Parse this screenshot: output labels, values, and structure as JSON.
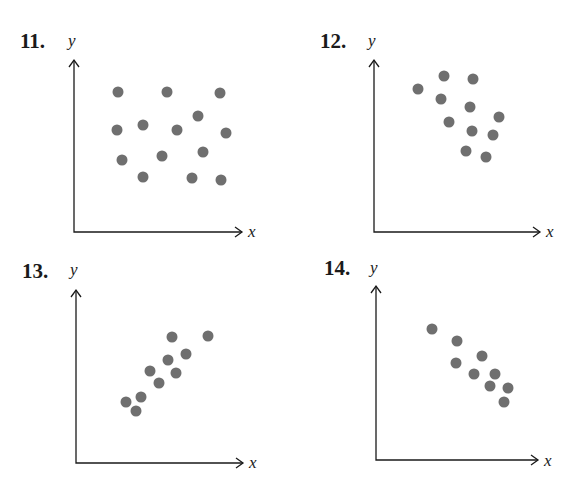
{
  "chart_data": [
    {
      "type": "scatter",
      "title": "11.",
      "xlabel": "x",
      "ylabel": "y",
      "grid": false,
      "description": "No correlation",
      "points_px": [
        [
          118,
          92
        ],
        [
          167,
          92
        ],
        [
          220,
          93
        ],
        [
          198,
          116
        ],
        [
          117,
          130
        ],
        [
          143,
          125
        ],
        [
          177,
          130
        ],
        [
          226,
          133
        ],
        [
          122,
          160
        ],
        [
          162,
          156
        ],
        [
          203,
          152
        ],
        [
          143,
          177
        ],
        [
          192,
          178
        ],
        [
          221,
          180
        ]
      ],
      "axes_px": {
        "origin": [
          74,
          232
        ],
        "y_top": 60,
        "x_right": 242
      }
    },
    {
      "type": "scatter",
      "title": "12.",
      "xlabel": "x",
      "ylabel": "y",
      "grid": false,
      "description": "Negative correlation (weak)",
      "points_px": [
        [
          418,
          89
        ],
        [
          444,
          76
        ],
        [
          473,
          79
        ],
        [
          441,
          99
        ],
        [
          470,
          107
        ],
        [
          499,
          117
        ],
        [
          449,
          122
        ],
        [
          472,
          131
        ],
        [
          493,
          135
        ],
        [
          466,
          151
        ],
        [
          486,
          157
        ]
      ],
      "axes_px": {
        "origin": [
          374,
          232
        ],
        "y_top": 60,
        "x_right": 540
      }
    },
    {
      "type": "scatter",
      "title": "13.",
      "xlabel": "x",
      "ylabel": "y",
      "grid": false,
      "description": "Positive correlation",
      "points_px": [
        [
          172,
          337
        ],
        [
          208,
          336
        ],
        [
          186,
          354
        ],
        [
          168,
          360
        ],
        [
          150,
          371
        ],
        [
          176,
          373
        ],
        [
          159,
          383
        ],
        [
          141,
          397
        ],
        [
          126,
          402
        ],
        [
          136,
          411
        ]
      ],
      "axes_px": {
        "origin": [
          76,
          463
        ],
        "y_top": 290,
        "x_right": 243
      }
    },
    {
      "type": "scatter",
      "title": "14.",
      "xlabel": "x",
      "ylabel": "y",
      "grid": false,
      "description": "Negative correlation (strong)",
      "points_px": [
        [
          432,
          329
        ],
        [
          457,
          341
        ],
        [
          482,
          356
        ],
        [
          456,
          363
        ],
        [
          474,
          374
        ],
        [
          495,
          374
        ],
        [
          490,
          386
        ],
        [
          508,
          388
        ],
        [
          504,
          402
        ]
      ],
      "axes_px": {
        "origin": [
          376,
          460
        ],
        "y_top": 286,
        "x_right": 538
      }
    }
  ],
  "labels": {
    "p11": {
      "num": "11.",
      "y": "y",
      "x": "x"
    },
    "p12": {
      "num": "12.",
      "y": "y",
      "x": "x"
    },
    "p13": {
      "num": "13.",
      "y": "y",
      "x": "x"
    },
    "p14": {
      "num": "14.",
      "y": "y",
      "x": "x"
    }
  },
  "style": {
    "dot_color": "#6f6f6f",
    "axis_color": "#1a1a1a",
    "dot_radius": 5.5
  }
}
